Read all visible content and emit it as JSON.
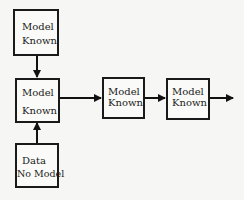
{
  "diagram": {
    "nodes": [
      {
        "id": "top",
        "lines": [
          "Model",
          "Known"
        ]
      },
      {
        "id": "center",
        "lines": [
          "Model",
          "Known"
        ]
      },
      {
        "id": "bottom",
        "lines": [
          "Data",
          "No Model"
        ]
      },
      {
        "id": "right1",
        "lines": [
          "Model",
          "Known"
        ]
      },
      {
        "id": "right2",
        "lines": [
          "Model",
          "Known"
        ]
      }
    ],
    "edges": [
      {
        "from": "top",
        "to": "center"
      },
      {
        "from": "bottom",
        "to": "center"
      },
      {
        "from": "center",
        "to": "right1"
      },
      {
        "from": "right1",
        "to": "right2"
      },
      {
        "from": "right2",
        "to": "outside"
      }
    ]
  }
}
